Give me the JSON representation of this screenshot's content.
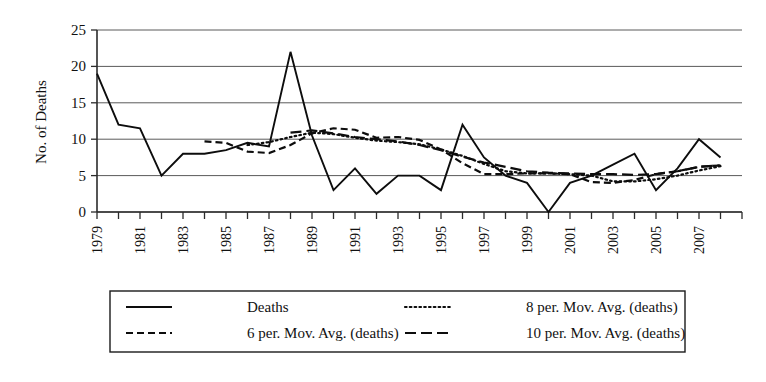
{
  "chart_data": {
    "type": "line",
    "title": "",
    "xlabel": "",
    "ylabel": "No. of Deaths",
    "ylim": [
      0,
      25
    ],
    "yticks": [
      0,
      5,
      10,
      15,
      20,
      25
    ],
    "grid": true,
    "legend_position": "bottom",
    "x": [
      1979,
      1980,
      1981,
      1982,
      1983,
      1984,
      1985,
      1986,
      1987,
      1988,
      1989,
      1990,
      1991,
      1992,
      1993,
      1994,
      1995,
      1996,
      1997,
      1998,
      1999,
      2000,
      2001,
      2002,
      2003,
      2004,
      2005,
      2006,
      2007,
      2008
    ],
    "xtick_labels": [
      "1979",
      "1981",
      "1983",
      "1985",
      "1987",
      "1989",
      "1991",
      "1993",
      "1995",
      "1997",
      "1999",
      "2001",
      "2003",
      "2005",
      "2007"
    ],
    "xtick_values": [
      1979,
      1981,
      1983,
      1985,
      1987,
      1989,
      1991,
      1993,
      1995,
      1997,
      1999,
      2001,
      2003,
      2005,
      2007
    ],
    "series": [
      {
        "name": "Deaths",
        "style": "solid",
        "x": [
          1979,
          1980,
          1981,
          1982,
          1983,
          1984,
          1985,
          1986,
          1987,
          1988,
          1989,
          1990,
          1991,
          1992,
          1993,
          1994,
          1995,
          1996,
          1997,
          1998,
          1999,
          2000,
          2001,
          2002,
          2003,
          2004,
          2005,
          2006,
          2007,
          2008
        ],
        "values": [
          19,
          12,
          11.5,
          5,
          8,
          8,
          8.5,
          9.5,
          9,
          22,
          10.5,
          3,
          6,
          2.5,
          5,
          5,
          3,
          12,
          7.5,
          5,
          4,
          0,
          4,
          5,
          6.5,
          8,
          3,
          6,
          10,
          7.5
        ]
      },
      {
        "name": "6 per. Mov. Avg. (deaths)",
        "style": "dashed",
        "x": [
          1984,
          1985,
          1986,
          1987,
          1988,
          1989,
          1990,
          1991,
          1992,
          1993,
          1994,
          1995,
          1996,
          1997,
          1998,
          1999,
          2000,
          2001,
          2002,
          2003,
          2004,
          2005,
          2006,
          2007,
          2008
        ],
        "values": [
          9.7,
          9.5,
          8.3,
          8.1,
          9.2,
          10.8,
          11.5,
          11.3,
          10.2,
          10.3,
          9.9,
          8.6,
          6.7,
          5.2,
          5.2,
          5.3,
          5.3,
          5.2,
          4.1,
          4.0,
          4.4,
          5.2,
          5.6,
          6.2,
          6.4
        ]
      },
      {
        "name": "8 per. Mov. Avg. (deaths)",
        "style": "dotted",
        "x": [
          1986,
          1987,
          1988,
          1989,
          1990,
          1991,
          1992,
          1993,
          1994,
          1995,
          1996,
          1997,
          1998,
          1999,
          2000,
          2001,
          2002,
          2003,
          2004,
          2005,
          2006,
          2007,
          2008
        ],
        "values": [
          9.2,
          9.6,
          10.3,
          10.9,
          10.7,
          10.2,
          9.8,
          9.6,
          9.3,
          8.6,
          7.7,
          6.6,
          5.6,
          5.3,
          5.3,
          5.2,
          5.0,
          4.2,
          4.2,
          4.5,
          5.0,
          5.7,
          6.3
        ]
      },
      {
        "name": "10 per. Mov. Avg. (deaths)",
        "style": "dashdot",
        "x": [
          1988,
          1989,
          1990,
          1991,
          1992,
          1993,
          1994,
          1995,
          1996,
          1997,
          1998,
          1999,
          2000,
          2001,
          2002,
          2003,
          2004,
          2005,
          2006,
          2007,
          2008
        ],
        "values": [
          10.9,
          11.2,
          10.8,
          10.3,
          10.0,
          9.7,
          9.2,
          8.5,
          7.6,
          6.8,
          6.2,
          5.6,
          5.4,
          5.3,
          5.2,
          5.2,
          5.1,
          5.2,
          5.6,
          6.2,
          6.4
        ]
      }
    ]
  },
  "legend": {
    "entries": [
      {
        "label": "Deaths",
        "style": "solid"
      },
      {
        "label": "8 per. Mov. Avg. (deaths)",
        "style": "dotted"
      },
      {
        "label": "6 per. Mov. Avg. (deaths)",
        "style": "dashed"
      },
      {
        "label": "10 per. Mov. Avg. (deaths)",
        "style": "dashdot"
      }
    ]
  },
  "colors": {
    "ink": "#0d0d0d",
    "grid": "#5a5a5a",
    "background": "#ffffff"
  }
}
